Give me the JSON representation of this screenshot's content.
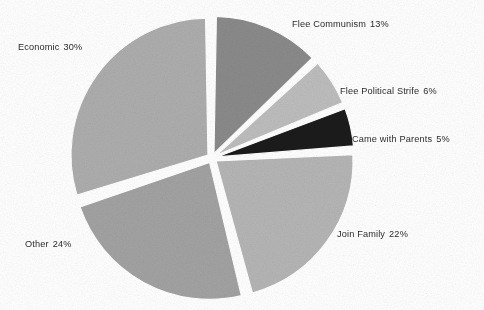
{
  "chart_data": {
    "type": "pie",
    "title": "",
    "subtitle": "",
    "xlabel": "",
    "ylabel": "",
    "legend_position": "outside-labels",
    "grid": false,
    "units": "percent",
    "total": 100,
    "start_angle_deg": 0,
    "direction": "clockwise",
    "exploded": true,
    "categories": [
      "Flee Communism",
      "Flee Political Strife",
      "Came with Parents",
      "Join Family",
      "Other",
      "Economic"
    ],
    "values": [
      13,
      6,
      5,
      22,
      24,
      30
    ],
    "value_labels": [
      "13%",
      "6%",
      "5%",
      "22%",
      "24%",
      "30%"
    ],
    "colors": [
      "#8a8a8a",
      "#bdbdbd",
      "#1b1b1b",
      "#b5b5b5",
      "#a2a2a2",
      "#adadad"
    ],
    "slices": [
      {
        "name": "Flee Communism",
        "label": "Flee Communism",
        "value": 13,
        "value_label": "13%",
        "color": "#8a8a8a",
        "label_x": 292,
        "label_y": 19
      },
      {
        "name": "Flee Political Strife",
        "label": "Flee Political Strife",
        "value": 6,
        "value_label": "6%",
        "color": "#bdbdbd",
        "label_x": 340,
        "label_y": 86
      },
      {
        "name": "Came with Parents",
        "label": "Came with Parents",
        "value": 5,
        "value_label": "5%",
        "color": "#1b1b1b",
        "label_x": 352,
        "label_y": 134
      },
      {
        "name": "Join Family",
        "label": "Join Family",
        "value": 22,
        "value_label": "22%",
        "color": "#b5b5b5",
        "label_x": 337,
        "label_y": 229
      },
      {
        "name": "Other",
        "label": "Other",
        "value": 24,
        "value_label": "24%",
        "color": "#a2a2a2",
        "label_x": 25,
        "label_y": 239
      },
      {
        "name": "Economic",
        "label": "Economic",
        "value": 30,
        "value_label": "30%",
        "color": "#adadad",
        "label_x": 18,
        "label_y": 42
      }
    ],
    "geometry": {
      "center_x": 212,
      "center_y": 158,
      "radius": 137,
      "explode_offset": 5,
      "gap_deg": 2.0,
      "background": "#ffffff"
    }
  }
}
